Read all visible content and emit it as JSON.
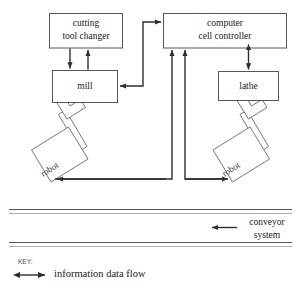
{
  "diagram": {
    "nodes": [
      {
        "id": "cutting-tool-changer",
        "label_line1": "cutting",
        "label_line2": "tool changer"
      },
      {
        "id": "computer-cell-controller",
        "label_line1": "computer",
        "label_line2": "cell controller"
      },
      {
        "id": "mill",
        "label_line1": "mill",
        "label_line2": ""
      },
      {
        "id": "lathe",
        "label_line1": "lathe",
        "label_line2": ""
      },
      {
        "id": "robot-left",
        "label_line1": "robot",
        "label_line2": ""
      },
      {
        "id": "robot-right",
        "label_line1": "robot",
        "label_line2": ""
      }
    ],
    "conveyor": {
      "label_line1": "conveyor",
      "label_line2": "system",
      "direction": "leftward"
    },
    "key": {
      "heading": "KEY:",
      "legend_label": "information data flow",
      "arrow_style": "double-headed"
    },
    "colors": {
      "background": "#ffffff",
      "box_stroke": "#555555",
      "arrow_stroke": "#2e2e2e",
      "robot_stroke": "#777777",
      "text": "#1a1a1a"
    }
  }
}
